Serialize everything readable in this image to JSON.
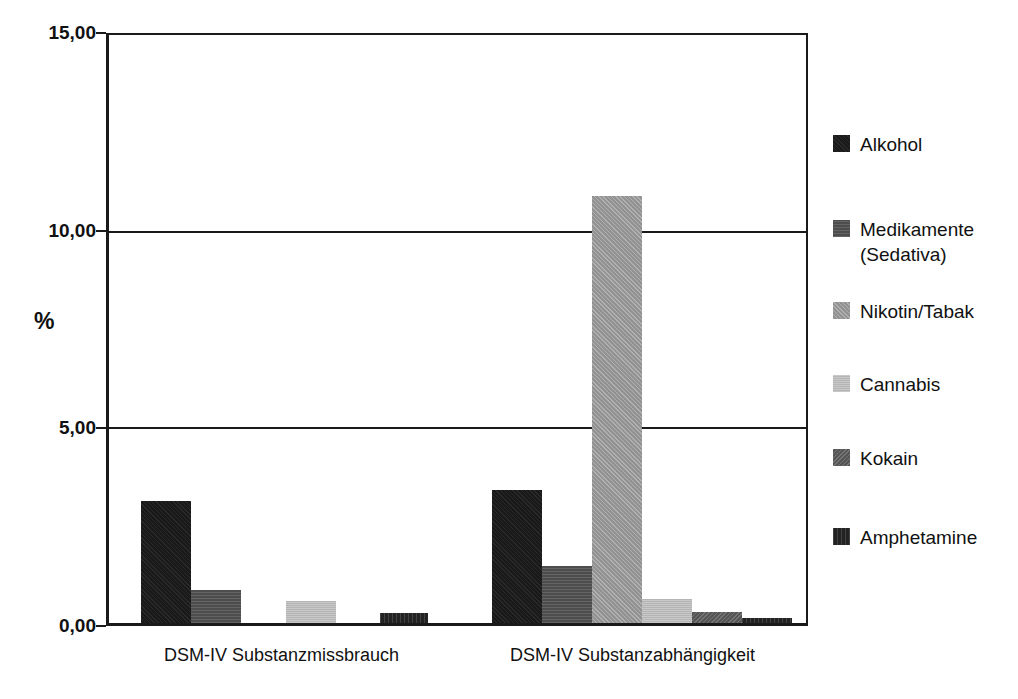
{
  "chart_data": {
    "type": "bar",
    "title": "",
    "subtitle": "",
    "xlabel": "",
    "ylabel": "%",
    "ylim": [
      0,
      15
    ],
    "yticks": [
      "0,00",
      "5,00",
      "10,00",
      "15,00"
    ],
    "ytick_values": [
      0,
      5,
      10,
      15
    ],
    "grid": "horizontal-gridlines-at-ticks",
    "legend_position": "right",
    "categories": [
      "DSM-IV Substanzmissbrauch",
      "DSM-IV Substanzabhängigkeit"
    ],
    "series": [
      {
        "name": "Alkohol",
        "color": "#191919",
        "values": [
          3.1,
          3.4
        ]
      },
      {
        "name": "Medikamente\n(Sedativa)",
        "color": "#4d4d4d",
        "values": [
          0.85,
          1.45
        ]
      },
      {
        "name": "Nikotin/Tabak",
        "color": "#9a9a9a",
        "values": [
          0.0,
          10.9
        ]
      },
      {
        "name": "Cannabis",
        "color": "#bcbcbc",
        "values": [
          0.55,
          0.6
        ]
      },
      {
        "name": "Kokain",
        "color": "#5a5a5a",
        "values": [
          0.0,
          0.28
        ]
      },
      {
        "name": "Amphetamine",
        "color": "#232323",
        "values": [
          0.25,
          0.12
        ]
      }
    ]
  },
  "axis": {
    "y_title": "%",
    "y_ticks": [
      {
        "label": "15,00",
        "value": 15
      },
      {
        "label": "10,00",
        "value": 10
      },
      {
        "label": "5,00",
        "value": 5
      },
      {
        "label": "0,00",
        "value": 0
      }
    ]
  },
  "categories": [
    {
      "label": "DSM-IV Substanzmissbrauch"
    },
    {
      "label": "DSM-IV Substanzabhängigkeit"
    }
  ],
  "legend": {
    "items": [
      {
        "label": "Alkohol",
        "color": "#191919",
        "fill": "fill-alkohol",
        "top": 0
      },
      {
        "label": "Medikamente\n(Sedativa)",
        "color": "#4d4d4d",
        "fill": "fill-medikamente",
        "top": 85
      },
      {
        "label": "Nikotin/Tabak",
        "color": "#9a9a9a",
        "fill": "fill-nikotin",
        "top": 167
      },
      {
        "label": "Cannabis",
        "color": "#bcbcbc",
        "fill": "fill-cannabis",
        "top": 240
      },
      {
        "label": "Kokain",
        "color": "#5a5a5a",
        "fill": "fill-kokain",
        "top": 314
      },
      {
        "label": "Amphetamine",
        "color": "#232323",
        "fill": "fill-amphetamine",
        "top": 393
      }
    ]
  }
}
